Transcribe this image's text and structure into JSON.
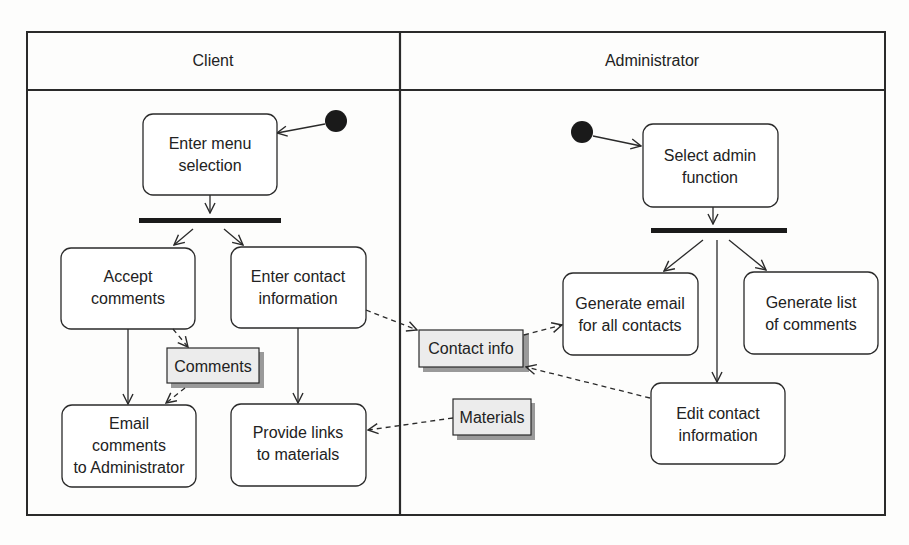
{
  "lanes": [
    {
      "title": "Client"
    },
    {
      "title": "Administrator"
    }
  ],
  "activities": {
    "enter_menu": [
      "Enter menu",
      "selection"
    ],
    "accept_comments": [
      "Accept",
      "comments"
    ],
    "enter_contact": [
      "Enter contact",
      "information"
    ],
    "email_comments": [
      "Email",
      "comments",
      "to Administrator"
    ],
    "provide_links": [
      "Provide links",
      "to materials"
    ],
    "select_admin": [
      "Select admin",
      "function"
    ],
    "generate_email": [
      "Generate email",
      "for all contacts"
    ],
    "generate_list": [
      "Generate list",
      "of comments"
    ],
    "edit_contact": [
      "Edit contact",
      "information"
    ]
  },
  "objects": {
    "comments": "Comments",
    "contact_info": "Contact info",
    "materials": "Materials"
  },
  "colors": {
    "line": "#2a2a2a",
    "object_fill": "#ececec",
    "object_shadow": "#9a9a9a",
    "background": "#fdfdfc"
  }
}
